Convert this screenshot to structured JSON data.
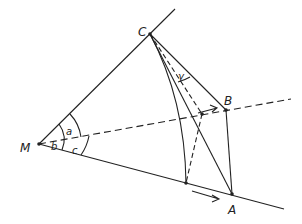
{
  "diagram": {
    "type": "geometry",
    "points": {
      "M": {
        "label": "M",
        "x": 39,
        "y": 144
      },
      "C": {
        "label": "C",
        "x": 150,
        "y": 34
      },
      "B": {
        "label": "B",
        "x": 226,
        "y": 110
      },
      "A": {
        "label": "A",
        "x": 232,
        "y": 194
      },
      "P1": {
        "x": 202,
        "y": 114
      },
      "P2": {
        "x": 186,
        "y": 183
      }
    },
    "angles": {
      "a": "a",
      "b": "b",
      "c": "c",
      "gamma": "γ"
    },
    "colors": {
      "line": "#222222",
      "background": "#ffffff"
    }
  }
}
